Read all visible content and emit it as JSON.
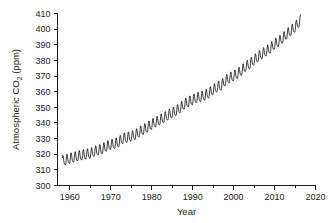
{
  "chart_data": {
    "type": "line",
    "title": "",
    "subtitle": "",
    "xlabel": "Year",
    "ylabel_text": "Atmospheric CO",
    "ylabel_sub": "2",
    "ylabel_unit": " (ppm)",
    "ylabel_full": "Atmospheric CO2 (ppm)",
    "xlim": [
      1957,
      2020
    ],
    "ylim": [
      300,
      410
    ],
    "xticks": [
      1960,
      1970,
      1980,
      1990,
      2000,
      2010,
      2020
    ],
    "xtick_labels": [
      "1960",
      "1970",
      "1980",
      "1990",
      "2000",
      "2010",
      "2020"
    ],
    "xminor_ticks": [
      1965,
      1975,
      1985,
      1995,
      2005,
      2015
    ],
    "yticks": [
      300,
      310,
      320,
      330,
      340,
      350,
      360,
      370,
      380,
      390,
      400,
      410
    ],
    "ytick_labels": [
      "300",
      "310",
      "320",
      "330",
      "340",
      "350",
      "360",
      "370",
      "380",
      "390",
      "400",
      "410"
    ],
    "grid": false,
    "legend": "none",
    "series_name": "Mauna Loa monthly mean CO2",
    "seasonal_amplitude_ppm": 3.2,
    "seasonal_peak_month": 5,
    "annual_mean": {
      "x": [
        1958,
        1959,
        1960,
        1961,
        1962,
        1963,
        1964,
        1965,
        1966,
        1967,
        1968,
        1969,
        1970,
        1971,
        1972,
        1973,
        1974,
        1975,
        1976,
        1977,
        1978,
        1979,
        1980,
        1981,
        1982,
        1983,
        1984,
        1985,
        1986,
        1987,
        1988,
        1989,
        1990,
        1991,
        1992,
        1993,
        1994,
        1995,
        1996,
        1997,
        1998,
        1999,
        2000,
        2001,
        2002,
        2003,
        2004,
        2005,
        2006,
        2007,
        2008,
        2009,
        2010,
        2011,
        2012,
        2013,
        2014,
        2015,
        2016
      ],
      "y": [
        315.3,
        315.9,
        316.9,
        317.6,
        318.4,
        319.0,
        319.6,
        320.0,
        321.4,
        322.2,
        323.0,
        324.6,
        325.7,
        326.3,
        327.5,
        329.7,
        330.2,
        331.1,
        332.0,
        333.8,
        335.4,
        336.8,
        338.7,
        340.1,
        341.4,
        343.0,
        344.6,
        346.0,
        347.4,
        349.2,
        351.6,
        353.1,
        354.4,
        355.6,
        356.4,
        357.1,
        358.8,
        360.8,
        362.6,
        363.7,
        366.7,
        368.4,
        369.6,
        371.2,
        373.2,
        375.8,
        377.5,
        379.8,
        381.9,
        383.8,
        385.6,
        387.4,
        389.9,
        391.6,
        393.8,
        396.5,
        398.6,
        400.8,
        404.2
      ]
    },
    "first_point": {
      "year": 1958.2,
      "co2": 315.7
    },
    "last_point": {
      "year": 2016.4,
      "co2": 407.7
    },
    "range_note": "300 to 410 ppm",
    "colors": {
      "line": "#1a1a1a",
      "axis": "#1a1a1a",
      "background": "#ffffff"
    }
  }
}
